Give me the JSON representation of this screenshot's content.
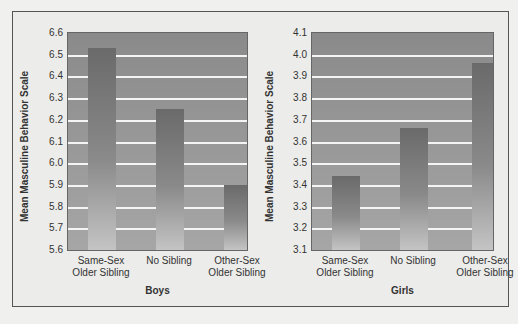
{
  "chart_data": [
    {
      "type": "bar",
      "title": "Boys",
      "xlabel": "Boys",
      "ylabel": "Mean Masculine Behavior Scale",
      "categories": [
        "Same-Sex Older Sibling",
        "No Sibling",
        "Other-Sex Older Sibling"
      ],
      "values": [
        6.53,
        6.25,
        5.9
      ],
      "ylim": [
        5.6,
        6.6
      ],
      "yticks": [
        "5.6",
        "5.7",
        "5.8",
        "5.9",
        "6.0",
        "6.1",
        "6.2",
        "6.3",
        "6.4",
        "6.5",
        "6.6"
      ],
      "grid": true
    },
    {
      "type": "bar",
      "title": "Girls",
      "xlabel": "Girls",
      "ylabel": "Mean Masculine Behavior Scale",
      "categories": [
        "Same-Sex Older Sibling",
        "No Sibling",
        "Other-Sex Older Sibling"
      ],
      "values": [
        3.44,
        3.66,
        3.96
      ],
      "ylim": [
        3.1,
        4.1
      ],
      "yticks": [
        "3.1",
        "3.2",
        "3.3",
        "3.4",
        "3.5",
        "3.6",
        "3.7",
        "3.8",
        "3.9",
        "4.0",
        "4.1"
      ],
      "grid": true
    }
  ],
  "panels": [
    {
      "group": "Boys",
      "ylabel": "Mean Masculine Behavior Scale",
      "cats": [
        [
          "Same-Sex",
          "Older Sibling"
        ],
        [
          "No Sibling",
          ""
        ],
        [
          "Other-Sex",
          "Older Sibling"
        ]
      ]
    },
    {
      "group": "Girls",
      "ylabel": "Mean Masculine Behavior Scale",
      "cats": [
        [
          "Same-Sex",
          "Older Sibling"
        ],
        [
          "No Sibling",
          ""
        ],
        [
          "Other-Sex",
          "Older Sibling"
        ]
      ]
    }
  ]
}
